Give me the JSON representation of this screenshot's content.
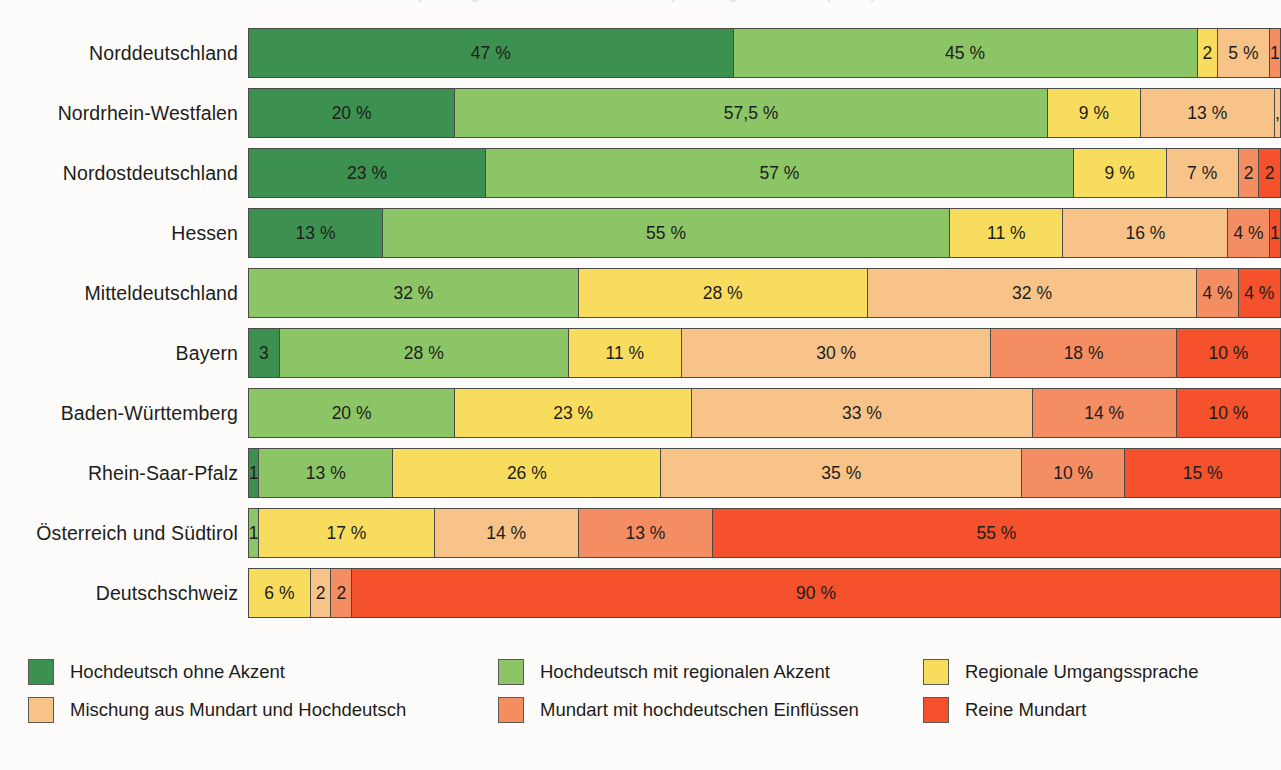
{
  "title": "Sprachgebrauch im deutschsprachigen Raum (in %)",
  "legend": {
    "position": "bottom",
    "items": [
      {
        "label": "Hochdeutsch ohne Akzent",
        "color": "#3d9150",
        "key": "hochdeutsch_ohne_akzent"
      },
      {
        "label": "Hochdeutsch mit regionalen Akzent",
        "color": "#8cc565",
        "key": "hochdeutsch_mit_akzent"
      },
      {
        "label": "Regionale Umgangssprache",
        "color": "#f8dc5e",
        "key": "regionale_umgangssprache"
      },
      {
        "label": "Mischung aus Mundart und Hochdeutsch",
        "color": "#f7c389",
        "key": "mischung"
      },
      {
        "label": "Mundart mit hochdeutschen Einflüssen",
        "color": "#f58d63",
        "key": "mundart_mit_einfluessen"
      },
      {
        "label": "Reine Mundart",
        "color": "#f4512c",
        "key": "reine_mundart"
      }
    ]
  },
  "chart_data": {
    "type": "bar",
    "orientation": "horizontal",
    "stacked": true,
    "normalized": true,
    "title": "Sprachgebrauch im deutschsprachigen Raum (in %)",
    "xlabel": "",
    "ylabel": "",
    "xlim": [
      0,
      100
    ],
    "grid": false,
    "legend_position": "bottom",
    "unit": "%",
    "categories": [
      "Norddeutschland",
      "Nordrhein-Westfalen",
      "Nordostdeutschland",
      "Hessen",
      "Mitteldeutschland",
      "Bayern",
      "Baden-Württemberg",
      "Rhein-Saar-Pfalz",
      "Österreich und Südtirol",
      "Deutschschweiz"
    ],
    "series": [
      {
        "name": "Hochdeutsch ohne Akzent",
        "color": "#3d9150",
        "values": [
          47,
          20,
          23,
          13,
          0,
          3,
          0,
          1,
          0,
          0
        ]
      },
      {
        "name": "Hochdeutsch mit regionalen Akzent",
        "color": "#8cc565",
        "values": [
          45,
          57.5,
          57,
          55,
          32,
          28,
          20,
          13,
          1,
          0
        ]
      },
      {
        "name": "Regionale Umgangssprache",
        "color": "#f8dc5e",
        "values": [
          2,
          9,
          9,
          11,
          28,
          11,
          23,
          26,
          17,
          6
        ]
      },
      {
        "name": "Mischung aus Mundart und Hochdeutsch",
        "color": "#f7c389",
        "values": [
          5,
          13,
          7,
          16,
          32,
          30,
          33,
          35,
          14,
          2
        ]
      },
      {
        "name": "Mundart mit hochdeutschen Einflüssen",
        "color": "#f58d63",
        "values": [
          1,
          0.5,
          2,
          4,
          4,
          18,
          14,
          10,
          13,
          2
        ]
      },
      {
        "name": "Reine Mundart",
        "color": "#f4512c",
        "values": [
          0,
          0,
          2,
          1,
          4,
          10,
          10,
          15,
          55,
          90
        ]
      }
    ]
  },
  "rows": [
    {
      "label": "Norddeutschland",
      "segments": [
        {
          "key": "hochdeutsch_ohne_akzent",
          "value": 47,
          "text": "47 %",
          "color": "#3d9150"
        },
        {
          "key": "hochdeutsch_mit_akzent",
          "value": 45,
          "text": "45 %",
          "color": "#8cc565"
        },
        {
          "key": "regionale_umgangssprache",
          "value": 2,
          "text": "2",
          "color": "#f8dc5e"
        },
        {
          "key": "mischung",
          "value": 5,
          "text": "5 %",
          "color": "#f7c389"
        },
        {
          "key": "mundart_mit_einfluessen",
          "value": 1,
          "text": "1",
          "color": "#f58d63"
        }
      ]
    },
    {
      "label": "Nordrhein-Westfalen",
      "segments": [
        {
          "key": "hochdeutsch_ohne_akzent",
          "value": 20,
          "text": "20 %",
          "color": "#3d9150"
        },
        {
          "key": "hochdeutsch_mit_akzent",
          "value": 57.5,
          "text": "57,5 %",
          "color": "#8cc565"
        },
        {
          "key": "regionale_umgangssprache",
          "value": 9,
          "text": "9 %",
          "color": "#f8dc5e"
        },
        {
          "key": "mischung",
          "value": 13,
          "text": "13 %",
          "color": "#f7c389"
        },
        {
          "key": "mischung_label_extra",
          "value": 0.5,
          "text": "0,5",
          "color": "#f7c389"
        }
      ]
    },
    {
      "label": "Nordostdeutschland",
      "segments": [
        {
          "key": "hochdeutsch_ohne_akzent",
          "value": 23,
          "text": "23 %",
          "color": "#3d9150"
        },
        {
          "key": "hochdeutsch_mit_akzent",
          "value": 57,
          "text": "57 %",
          "color": "#8cc565"
        },
        {
          "key": "regionale_umgangssprache",
          "value": 9,
          "text": "9 %",
          "color": "#f8dc5e"
        },
        {
          "key": "mischung",
          "value": 7,
          "text": "7 %",
          "color": "#f7c389"
        },
        {
          "key": "mundart_mit_einfluessen",
          "value": 2,
          "text": "2",
          "color": "#f58d63"
        },
        {
          "key": "reine_mundart",
          "value": 2,
          "text": "2",
          "color": "#f4512c"
        }
      ]
    },
    {
      "label": "Hessen",
      "segments": [
        {
          "key": "hochdeutsch_ohne_akzent",
          "value": 13,
          "text": "13 %",
          "color": "#3d9150"
        },
        {
          "key": "hochdeutsch_mit_akzent",
          "value": 55,
          "text": "55 %",
          "color": "#8cc565"
        },
        {
          "key": "regionale_umgangssprache",
          "value": 11,
          "text": "11 %",
          "color": "#f8dc5e"
        },
        {
          "key": "mischung",
          "value": 16,
          "text": "16 %",
          "color": "#f7c389"
        },
        {
          "key": "mundart_mit_einfluessen",
          "value": 4,
          "text": "4 %",
          "color": "#f58d63"
        },
        {
          "key": "reine_mundart",
          "value": 1,
          "text": "1",
          "color": "#f4512c"
        }
      ]
    },
    {
      "label": "Mitteldeutschland",
      "segments": [
        {
          "key": "hochdeutsch_mit_akzent",
          "value": 32,
          "text": "32 %",
          "color": "#8cc565"
        },
        {
          "key": "regionale_umgangssprache",
          "value": 28,
          "text": "28 %",
          "color": "#f8dc5e"
        },
        {
          "key": "mischung",
          "value": 32,
          "text": "32 %",
          "color": "#f7c389"
        },
        {
          "key": "mundart_mit_einfluessen",
          "value": 4,
          "text": "4 %",
          "color": "#f58d63"
        },
        {
          "key": "reine_mundart",
          "value": 4,
          "text": "4 %",
          "color": "#f4512c"
        }
      ]
    },
    {
      "label": "Bayern",
      "segments": [
        {
          "key": "hochdeutsch_ohne_akzent",
          "value": 3,
          "text": "3",
          "color": "#3d9150"
        },
        {
          "key": "hochdeutsch_mit_akzent",
          "value": 28,
          "text": "28 %",
          "color": "#8cc565"
        },
        {
          "key": "regionale_umgangssprache",
          "value": 11,
          "text": "11 %",
          "color": "#f8dc5e"
        },
        {
          "key": "mischung",
          "value": 30,
          "text": "30 %",
          "color": "#f7c389"
        },
        {
          "key": "mundart_mit_einfluessen",
          "value": 18,
          "text": "18 %",
          "color": "#f58d63"
        },
        {
          "key": "reine_mundart",
          "value": 10,
          "text": "10 %",
          "color": "#f4512c"
        }
      ]
    },
    {
      "label": "Baden-Württemberg",
      "segments": [
        {
          "key": "hochdeutsch_mit_akzent",
          "value": 20,
          "text": "20 %",
          "color": "#8cc565"
        },
        {
          "key": "regionale_umgangssprache",
          "value": 23,
          "text": "23 %",
          "color": "#f8dc5e"
        },
        {
          "key": "mischung",
          "value": 33,
          "text": "33 %",
          "color": "#f7c389"
        },
        {
          "key": "mundart_mit_einfluessen",
          "value": 14,
          "text": "14 %",
          "color": "#f58d63"
        },
        {
          "key": "reine_mundart",
          "value": 10,
          "text": "10 %",
          "color": "#f4512c"
        }
      ]
    },
    {
      "label": "Rhein-Saar-Pfalz",
      "segments": [
        {
          "key": "hochdeutsch_ohne_akzent",
          "value": 1,
          "text": "1",
          "color": "#3d9150"
        },
        {
          "key": "hochdeutsch_mit_akzent",
          "value": 13,
          "text": "13 %",
          "color": "#8cc565"
        },
        {
          "key": "regionale_umgangssprache",
          "value": 26,
          "text": "26 %",
          "color": "#f8dc5e"
        },
        {
          "key": "mischung",
          "value": 35,
          "text": "35 %",
          "color": "#f7c389"
        },
        {
          "key": "mundart_mit_einfluessen",
          "value": 10,
          "text": "10 %",
          "color": "#f58d63"
        },
        {
          "key": "reine_mundart",
          "value": 15,
          "text": "15 %",
          "color": "#f4512c"
        }
      ]
    },
    {
      "label": "Österreich und Südtirol",
      "segments": [
        {
          "key": "hochdeutsch_mit_akzent",
          "value": 1,
          "text": "1",
          "color": "#8cc565"
        },
        {
          "key": "regionale_umgangssprache",
          "value": 17,
          "text": "17 %",
          "color": "#f8dc5e"
        },
        {
          "key": "mischung",
          "value": 14,
          "text": "14 %",
          "color": "#f7c389"
        },
        {
          "key": "mundart_mit_einfluessen",
          "value": 13,
          "text": "13 %",
          "color": "#f58d63"
        },
        {
          "key": "reine_mundart",
          "value": 55,
          "text": "55 %",
          "color": "#f4512c"
        }
      ]
    },
    {
      "label": "Deutschschweiz",
      "segments": [
        {
          "key": "regionale_umgangssprache",
          "value": 6,
          "text": "6 %",
          "color": "#f8dc5e"
        },
        {
          "key": "mischung",
          "value": 2,
          "text": "2",
          "color": "#f7c389"
        },
        {
          "key": "mundart_mit_einfluessen",
          "value": 2,
          "text": "2",
          "color": "#f58d63"
        },
        {
          "key": "reine_mundart",
          "value": 90,
          "text": "90 %",
          "color": "#f4512c"
        }
      ]
    }
  ]
}
